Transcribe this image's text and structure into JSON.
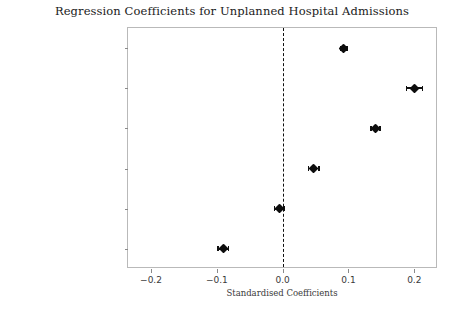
{
  "chart_data": {
    "type": "scatter",
    "title": "Regression Coefficients for Unplanned Hospital Admissions",
    "xlabel": "Standardised Coefficients",
    "ylabel": "",
    "xlim": [
      -0.235,
      0.236
    ],
    "grid": false,
    "legend": null,
    "reference_line": {
      "x": 0.0,
      "style": "dashed",
      "color": "#111111"
    },
    "xticks": [
      -0.2,
      -0.1,
      0.0,
      0.1,
      0.2
    ],
    "xticklabels": [
      "−0.2",
      "−0.1",
      "0.0",
      "0.1",
      "0.2"
    ],
    "categories": [
      "Age",
      "Smoker",
      "No Smoking Status",
      "Ex Smoker",
      "Female",
      "GP Management Plan"
    ],
    "values": [
      0.093,
      0.2,
      0.141,
      0.047,
      -0.005,
      -0.09
    ],
    "error_low": [
      0.088,
      0.188,
      0.134,
      0.039,
      -0.012,
      -0.098
    ],
    "error_high": [
      0.098,
      0.212,
      0.148,
      0.055,
      0.002,
      -0.082
    ],
    "marker": "diamond",
    "marker_color": "#0d0d0d",
    "errorbar_color": "#101010"
  }
}
